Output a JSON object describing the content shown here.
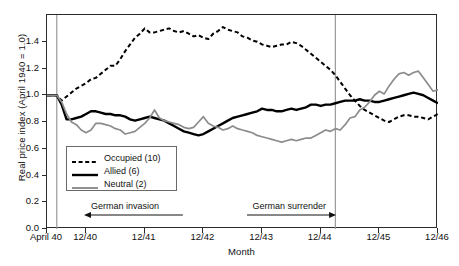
{
  "chart_data": {
    "type": "line",
    "title": "",
    "xlabel": "Month",
    "ylabel": "Real price index (April 1940 = 1.0)",
    "ylim": [
      0.0,
      1.6
    ],
    "xlim": [
      0,
      80
    ],
    "grid": false,
    "legend_position": "inside-lower-left",
    "yticks": [
      "0.0",
      "0.2",
      "0.4",
      "0.6",
      "0.8",
      "1.0",
      "1.2",
      "1.4"
    ],
    "ytick_values": [
      0.0,
      0.2,
      0.4,
      0.6,
      0.8,
      1.0,
      1.2,
      1.4
    ],
    "xticks": [
      "April 40",
      "12/40",
      "12/41",
      "12/42",
      "12/43",
      "12/44",
      "12/45",
      "12/46"
    ],
    "xtick_values": [
      0,
      8,
      20,
      32,
      44,
      56,
      68,
      80
    ],
    "annotations": [
      {
        "text": "German invasion",
        "arrow": "left",
        "x_start": 8,
        "x_end": 27,
        "y": 0.1
      },
      {
        "text": "German surrender",
        "arrow": "right",
        "x_start": 41,
        "x_end": 58,
        "y": 0.1
      }
    ],
    "vlines": [
      {
        "x": 2,
        "label": "german-invasion-line",
        "color": "#9a9a9a"
      },
      {
        "x": 59,
        "label": "german-surrender-line",
        "color": "#9a9a9a"
      }
    ],
    "series": [
      {
        "name": "Occupied (10)",
        "count": 10,
        "style": "dashed",
        "color": "#000000",
        "width": 2.0,
        "values": [
          1.0,
          1.0,
          1.0,
          0.96,
          0.99,
          1.02,
          1.05,
          1.07,
          1.09,
          1.12,
          1.13,
          1.16,
          1.19,
          1.22,
          1.22,
          1.27,
          1.33,
          1.38,
          1.43,
          1.46,
          1.5,
          1.47,
          1.47,
          1.48,
          1.49,
          1.5,
          1.48,
          1.47,
          1.48,
          1.46,
          1.44,
          1.45,
          1.43,
          1.42,
          1.46,
          1.48,
          1.51,
          1.49,
          1.48,
          1.47,
          1.44,
          1.43,
          1.41,
          1.4,
          1.38,
          1.37,
          1.36,
          1.37,
          1.38,
          1.38,
          1.4,
          1.39,
          1.37,
          1.34,
          1.31,
          1.28,
          1.25,
          1.22,
          1.19,
          1.15,
          1.1,
          1.05,
          1.0,
          0.96,
          0.92,
          0.89,
          0.87,
          0.85,
          0.83,
          0.81,
          0.8,
          0.82,
          0.84,
          0.85,
          0.85,
          0.84,
          0.84,
          0.83,
          0.82,
          0.84,
          0.86
        ]
      },
      {
        "name": "Allied (6)",
        "count": 6,
        "style": "solid",
        "color": "#000000",
        "width": 2.4,
        "values": [
          1.0,
          1.0,
          1.0,
          0.93,
          0.82,
          0.82,
          0.83,
          0.84,
          0.86,
          0.88,
          0.88,
          0.87,
          0.86,
          0.86,
          0.85,
          0.85,
          0.84,
          0.82,
          0.81,
          0.82,
          0.83,
          0.84,
          0.83,
          0.82,
          0.81,
          0.79,
          0.77,
          0.75,
          0.73,
          0.72,
          0.71,
          0.7,
          0.71,
          0.73,
          0.75,
          0.77,
          0.79,
          0.81,
          0.83,
          0.84,
          0.85,
          0.86,
          0.87,
          0.88,
          0.9,
          0.89,
          0.89,
          0.88,
          0.88,
          0.89,
          0.9,
          0.89,
          0.9,
          0.91,
          0.93,
          0.93,
          0.92,
          0.93,
          0.93,
          0.94,
          0.95,
          0.96,
          0.96,
          0.96,
          0.97,
          0.96,
          0.96,
          0.95,
          0.95,
          0.96,
          0.97,
          0.98,
          0.99,
          1.0,
          1.01,
          1.02,
          1.01,
          1.0,
          0.98,
          0.96,
          0.94
        ]
      },
      {
        "name": "Neutral (2)",
        "count": 2,
        "style": "solid",
        "color": "#8c8c8c",
        "width": 1.7,
        "values": [
          1.0,
          1.0,
          1.0,
          0.95,
          0.86,
          0.8,
          0.78,
          0.74,
          0.72,
          0.74,
          0.79,
          0.79,
          0.78,
          0.77,
          0.75,
          0.74,
          0.71,
          0.72,
          0.73,
          0.76,
          0.79,
          0.83,
          0.89,
          0.83,
          0.81,
          0.8,
          0.79,
          0.78,
          0.76,
          0.75,
          0.76,
          0.8,
          0.84,
          0.79,
          0.77,
          0.76,
          0.74,
          0.75,
          0.77,
          0.75,
          0.74,
          0.73,
          0.72,
          0.7,
          0.69,
          0.68,
          0.67,
          0.66,
          0.65,
          0.66,
          0.67,
          0.66,
          0.67,
          0.68,
          0.68,
          0.7,
          0.72,
          0.74,
          0.73,
          0.75,
          0.74,
          0.78,
          0.83,
          0.84,
          0.89,
          0.91,
          0.95,
          1.0,
          1.03,
          1.01,
          1.07,
          1.12,
          1.16,
          1.17,
          1.15,
          1.17,
          1.18,
          1.13,
          1.08,
          1.03,
          1.04
        ]
      }
    ]
  },
  "legend": {
    "items": [
      {
        "label": "Occupied (10)",
        "style": "dashed",
        "color": "#000000"
      },
      {
        "label": "Allied (6)",
        "style": "solid",
        "color": "#000000"
      },
      {
        "label": "Neutral (2)",
        "style": "solid-gray",
        "color": "#8c8c8c"
      }
    ]
  },
  "axes": {
    "ylabel": "Real price index (April 1940 = 1.0)",
    "xlabel": "Month"
  }
}
